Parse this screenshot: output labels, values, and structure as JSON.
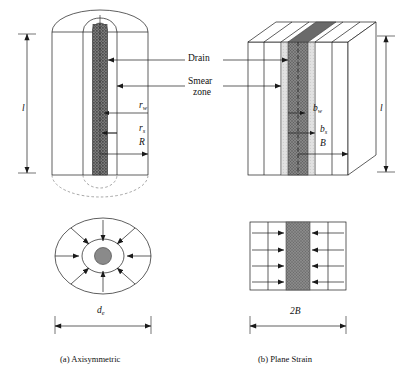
{
  "figure": {
    "type": "engineering-diagram",
    "panels": [
      {
        "id": "a",
        "caption": "(a) Axisymmetric",
        "shape": "cylinder"
      },
      {
        "id": "b",
        "caption": "(b) Plane Strain",
        "shape": "rectangular-prism"
      }
    ]
  },
  "annotations": {
    "drain": "Drain",
    "smear_line1": "Smear",
    "smear_line2": "zone"
  },
  "axisymmetric": {
    "height_symbol": "l",
    "drain_radius": {
      "base": "r",
      "sub": "w"
    },
    "smear_radius": {
      "base": "r",
      "sub": "s"
    },
    "cell_radius": "R",
    "diameter": {
      "base": "d",
      "sub": "e"
    },
    "plan_arrow_count": 8
  },
  "plane_strain": {
    "height_symbol": "l",
    "drain_halfwidth": {
      "base": "b",
      "sub": "w"
    },
    "smear_halfwidth": {
      "base": "b",
      "sub": "s"
    },
    "cell_halfwidth": "B",
    "width": "2B",
    "plan_arrow_rows": 4
  },
  "colors": {
    "line": "#1a1a1a",
    "drain_fill": "#6e6e6e",
    "smear_fill": "#b9b9b9",
    "dash": "#4a4a4a",
    "background": "#ffffff"
  }
}
